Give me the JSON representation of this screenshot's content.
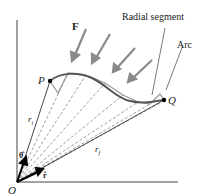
{
  "diagram": {
    "labels": {
      "force": "F",
      "radial_segment": "Radial segment",
      "arc": "Arc",
      "point_p": "P",
      "point_q": "Q",
      "r_initial": "r",
      "r_initial_sub": "i",
      "r_final": "r",
      "r_final_sub": "f",
      "unit_theta": "θ̂",
      "unit_r": "r̂",
      "origin": "O"
    },
    "colors": {
      "path": "#555555",
      "force_arrows": "#8a8a8a",
      "axes": "#333333",
      "dashed": "#888888",
      "vectors": "#000000"
    }
  }
}
